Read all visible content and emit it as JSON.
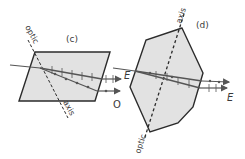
{
  "figure": {
    "panels": [
      {
        "id": "c",
        "label": "(c)",
        "shape": "parallelogram",
        "axis_top_label": "optic",
        "axis_bottom_label": "axis",
        "ray_labels": {
          "ordinary": "O",
          "extraordinary": "E"
        }
      },
      {
        "id": "d",
        "label": "(d)",
        "shape": "hexagon",
        "axis_top_label": "axis",
        "axis_bottom_label": "optic",
        "ray_labels": {
          "entry": "E",
          "exit": "E"
        }
      }
    ],
    "colors": {
      "crystal_fill": "#e2e2e2",
      "outline": "#2b2b2b",
      "ray": "#555555"
    }
  }
}
